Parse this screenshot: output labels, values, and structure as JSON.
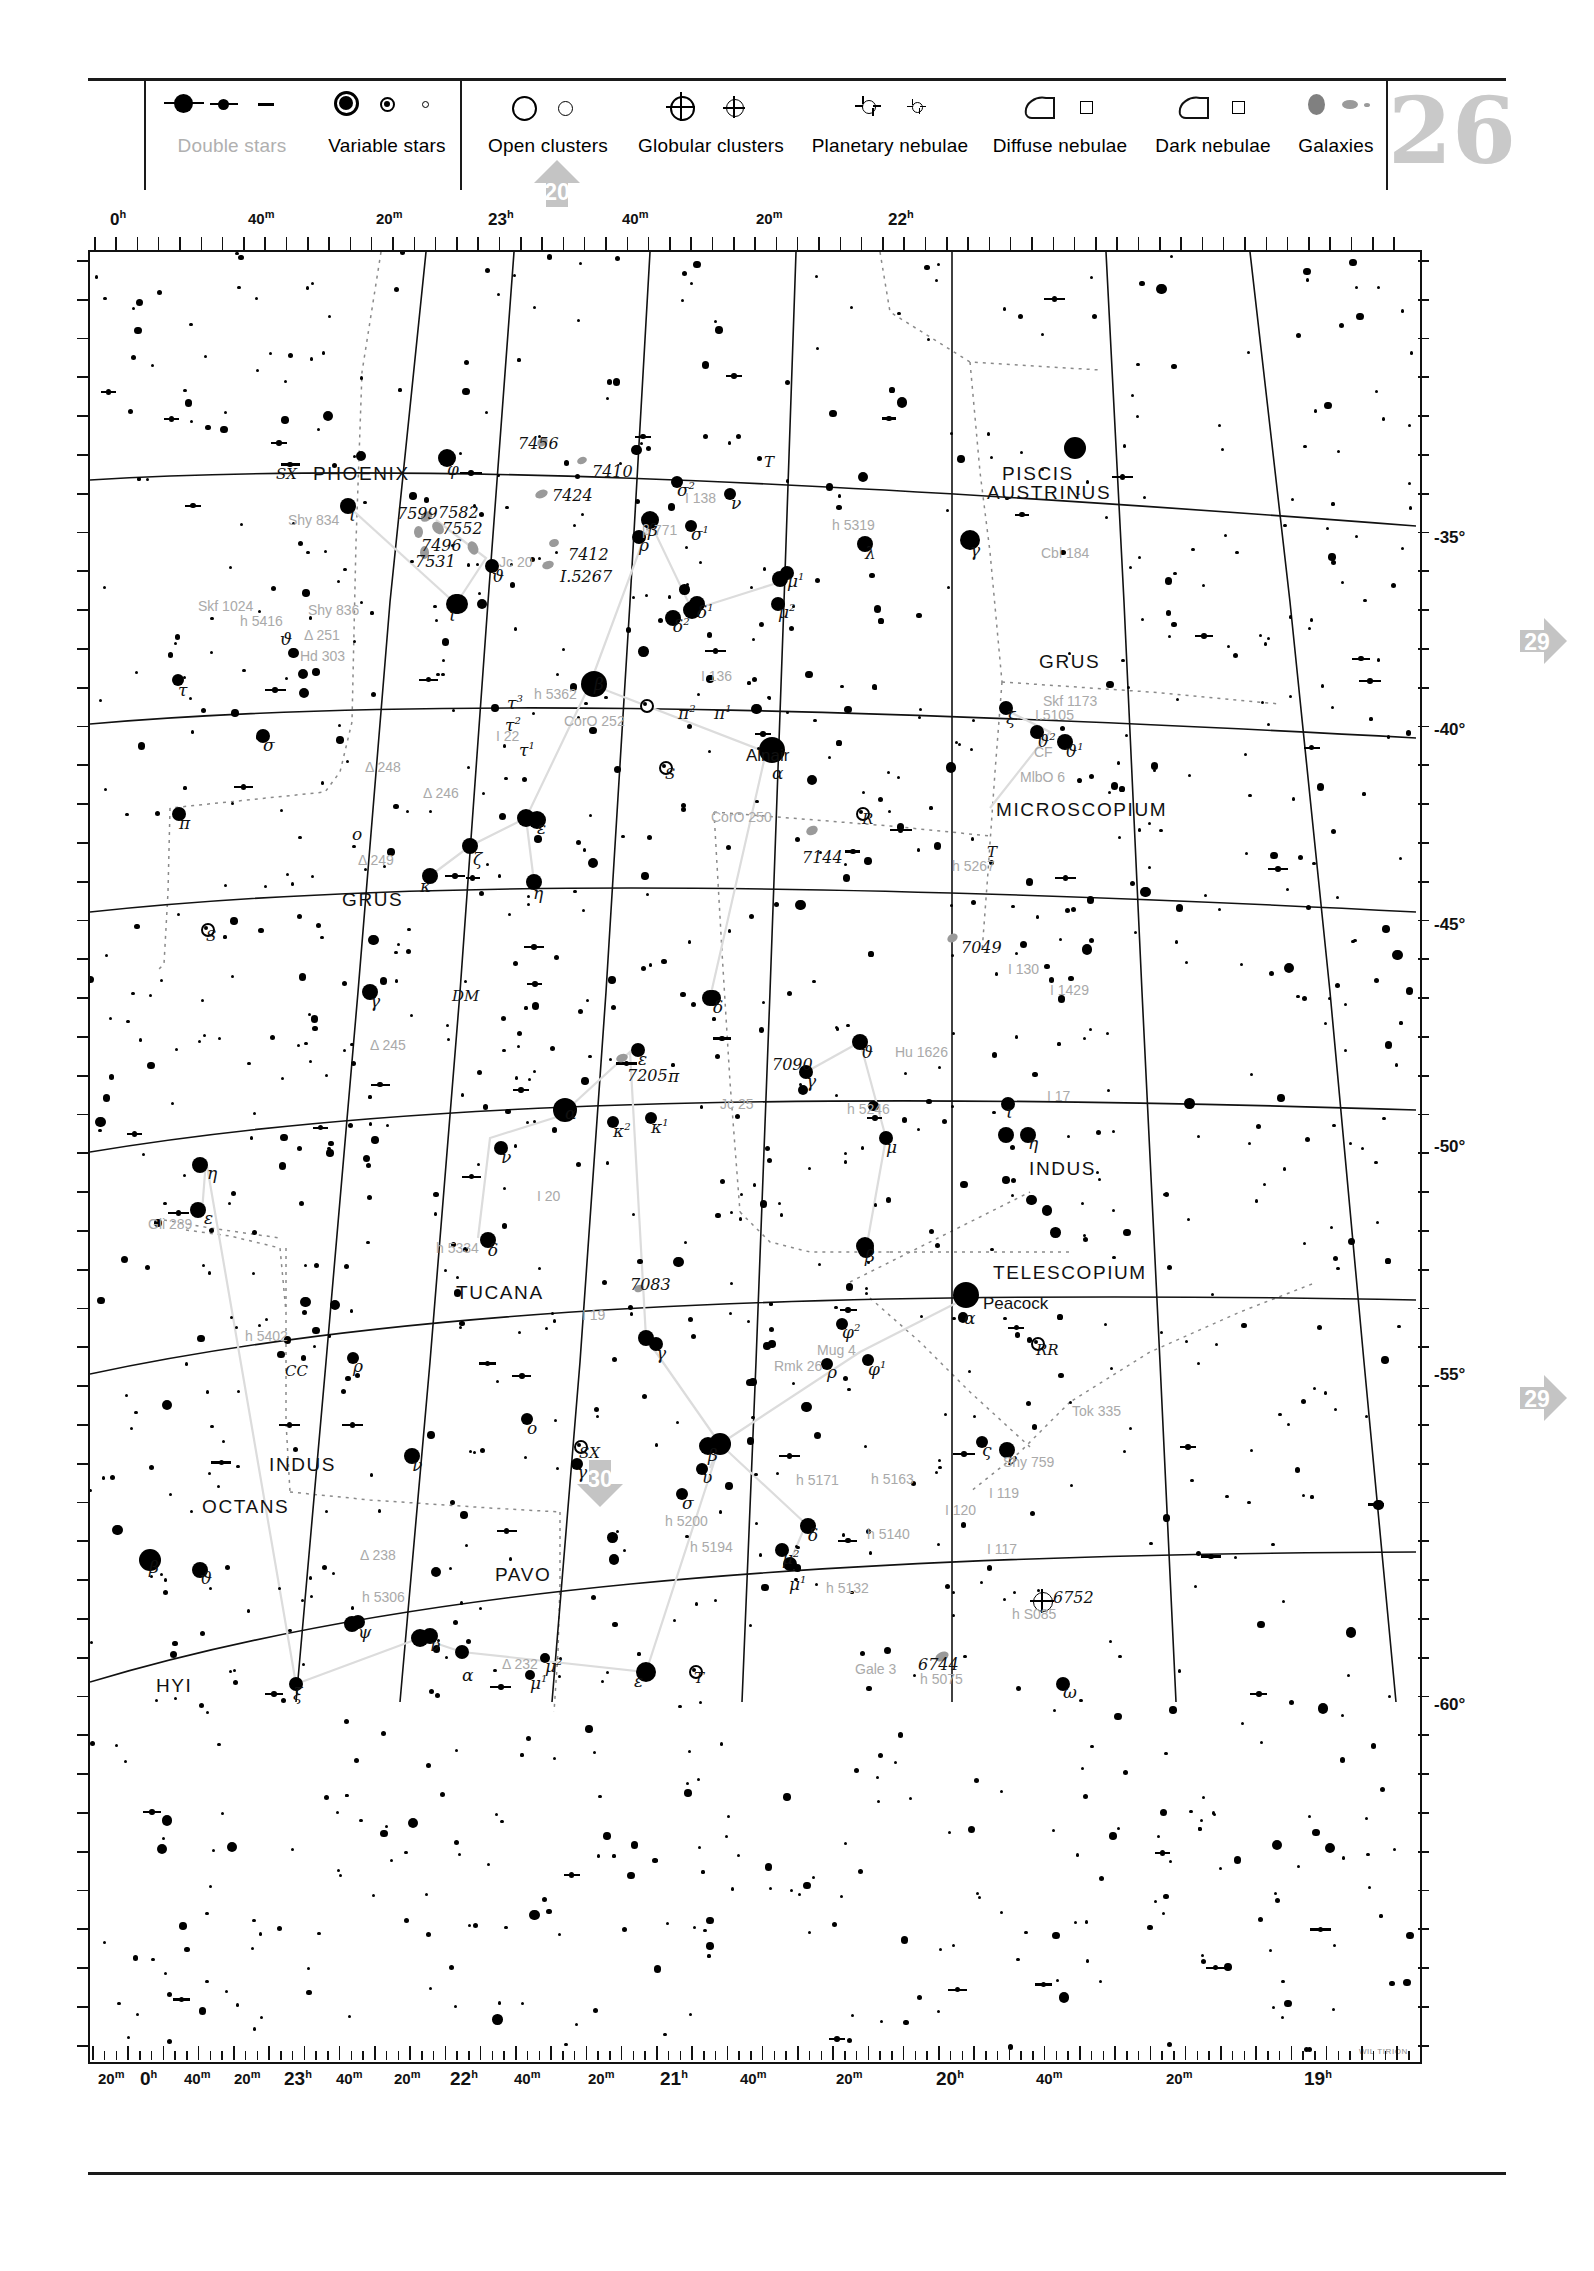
{
  "page": {
    "number": "26",
    "credit": "WIL TIRION"
  },
  "legend": {
    "groups": [
      {
        "items": [
          {
            "label": "Double stars",
            "icon": "double-star-symbol",
            "muted": true
          },
          {
            "label": "Variable stars",
            "icon": "variable-star-symbol",
            "muted": false
          }
        ]
      },
      {
        "items": [
          {
            "label": "Open clusters",
            "icon": "open-cluster-symbol",
            "muted": false
          },
          {
            "label": "Globular clusters",
            "icon": "globular-cluster-symbol",
            "muted": false
          },
          {
            "label": "Planetary nebulae",
            "icon": "planetary-nebula-symbol",
            "muted": false
          },
          {
            "label": "Diffuse nebulae",
            "icon": "diffuse-nebula-symbol",
            "muted": false
          },
          {
            "label": "Dark nebulae",
            "icon": "dark-nebula-symbol",
            "muted": false
          },
          {
            "label": "Galaxies",
            "icon": "galaxy-symbol",
            "muted": false
          }
        ]
      }
    ]
  },
  "chart": {
    "ra_top": [
      {
        "label": "0h",
        "x": 22
      },
      {
        "label": "40m",
        "x": 160
      },
      {
        "label": "20m",
        "x": 288
      },
      {
        "label": "23h",
        "x": 400
      },
      {
        "label": "40m",
        "x": 534
      },
      {
        "label": "20m",
        "x": 668
      },
      {
        "label": "22h",
        "x": 800
      }
    ],
    "ra_bottom": [
      {
        "label": "20m",
        "x": 10
      },
      {
        "label": "0h",
        "x": 52
      },
      {
        "label": "40m",
        "x": 96
      },
      {
        "label": "20m",
        "x": 146
      },
      {
        "label": "23h",
        "x": 196
      },
      {
        "label": "40m",
        "x": 248
      },
      {
        "label": "20m",
        "x": 306
      },
      {
        "label": "22h",
        "x": 362
      },
      {
        "label": "40m",
        "x": 426
      },
      {
        "label": "20m",
        "x": 500
      },
      {
        "label": "21h",
        "x": 572
      },
      {
        "label": "40m",
        "x": 652
      },
      {
        "label": "20m",
        "x": 748
      },
      {
        "label": "20h",
        "x": 848
      },
      {
        "label": "40m",
        "x": 948
      },
      {
        "label": "20m",
        "x": 1078
      },
      {
        "label": "19h",
        "x": 1216
      }
    ],
    "dec_labels": [
      {
        "label": "-35°",
        "y": 278
      },
      {
        "label": "-40°",
        "y": 470
      },
      {
        "label": "-45°",
        "y": 665
      },
      {
        "label": "-50°",
        "y": 887
      },
      {
        "label": "-55°",
        "y": 1115
      },
      {
        "label": "-60°",
        "y": 1445
      }
    ],
    "neighbour_arrows": [
      {
        "number": "20",
        "direction": "up",
        "x": 530,
        "y": 157
      },
      {
        "number": "29",
        "direction": "right",
        "x": 1516,
        "y": 614
      },
      {
        "number": "29",
        "direction": "right",
        "x": 1516,
        "y": 1371
      },
      {
        "number": "30",
        "direction": "down",
        "x": 573,
        "y": 1456
      }
    ],
    "constellations": [
      {
        "name": "PHOENIX",
        "x": 223,
        "y": 211
      },
      {
        "name": "PISCIS",
        "x": 912,
        "y": 211
      },
      {
        "name": "AUSTRINUS",
        "x": 897,
        "y": 230
      },
      {
        "name": "GRUS",
        "x": 949,
        "y": 399
      },
      {
        "name": "MICROSCOPIUM",
        "x": 906,
        "y": 547
      },
      {
        "name": "GRUS",
        "x": 252,
        "y": 637
      },
      {
        "name": "INDUS",
        "x": 939,
        "y": 906
      },
      {
        "name": "TUCANA",
        "x": 366,
        "y": 1030
      },
      {
        "name": "TELESCOPIUM",
        "x": 903,
        "y": 1010
      },
      {
        "name": "INDUS",
        "x": 179,
        "y": 1202
      },
      {
        "name": "OCTANS",
        "x": 112,
        "y": 1244
      },
      {
        "name": "PAVO",
        "x": 405,
        "y": 1312
      },
      {
        "name": "HYI",
        "x": 66,
        "y": 1423
      }
    ],
    "proper_names": [
      {
        "name": "Alnair",
        "x": 656,
        "y": 494
      },
      {
        "name": "Peacock",
        "x": 893,
        "y": 1042
      }
    ],
    "greek_labels": [
      {
        "t": "ι",
        "x": 985,
        "y": 227
      },
      {
        "t": "φ",
        "x": 357,
        "y": 207
      },
      {
        "t": "ι",
        "x": 259,
        "y": 253
      },
      {
        "t": "σ²",
        "x": 587,
        "y": 228
      },
      {
        "t": "ν",
        "x": 641,
        "y": 241
      },
      {
        "t": "β",
        "x": 558,
        "y": 268
      },
      {
        "t": "ρ",
        "x": 549,
        "y": 283
      },
      {
        "t": "σ¹",
        "x": 601,
        "y": 272
      },
      {
        "t": "γ",
        "x": 880,
        "y": 288
      },
      {
        "t": "λ",
        "x": 775,
        "y": 291
      },
      {
        "t": "ϑ",
        "x": 402,
        "y": 314
      },
      {
        "t": "μ¹",
        "x": 697,
        "y": 319
      },
      {
        "t": "ι",
        "x": 359,
        "y": 353
      },
      {
        "t": "δ¹",
        "x": 607,
        "y": 350
      },
      {
        "t": "μ²",
        "x": 688,
        "y": 350
      },
      {
        "t": "δ²",
        "x": 583,
        "y": 364
      },
      {
        "t": "ϑ",
        "x": 190,
        "y": 377
      },
      {
        "t": "τ",
        "x": 88,
        "y": 428
      },
      {
        "t": "β",
        "x": 504,
        "y": 422
      },
      {
        "t": "ξ",
        "x": 916,
        "y": 456
      },
      {
        "t": "τ³",
        "x": 417,
        "y": 441
      },
      {
        "t": "ϑ²",
        "x": 947,
        "y": 479
      },
      {
        "t": "τ²",
        "x": 415,
        "y": 463
      },
      {
        "t": "ϑ¹",
        "x": 975,
        "y": 489
      },
      {
        "t": "τ¹",
        "x": 429,
        "y": 488
      },
      {
        "t": "π²",
        "x": 588,
        "y": 451
      },
      {
        "t": "π¹",
        "x": 624,
        "y": 451
      },
      {
        "t": "α",
        "x": 682,
        "y": 511
      },
      {
        "t": "σ",
        "x": 173,
        "y": 483
      },
      {
        "t": "π",
        "x": 89,
        "y": 561
      },
      {
        "t": "ο",
        "x": 262,
        "y": 572
      },
      {
        "t": "ε",
        "x": 447,
        "y": 566
      },
      {
        "t": "ζ",
        "x": 383,
        "y": 597
      },
      {
        "t": "κ",
        "x": 330,
        "y": 624
      },
      {
        "t": "η",
        "x": 443,
        "y": 631
      },
      {
        "t": "γ",
        "x": 280,
        "y": 739
      },
      {
        "t": "δ",
        "x": 623,
        "y": 745
      },
      {
        "t": "ϑ",
        "x": 771,
        "y": 790
      },
      {
        "t": "ε",
        "x": 548,
        "y": 797
      },
      {
        "t": "γ",
        "x": 716,
        "y": 819
      },
      {
        "t": "π",
        "x": 578,
        "y": 814
      },
      {
        "t": "ι",
        "x": 916,
        "y": 850
      },
      {
        "t": "α",
        "x": 475,
        "y": 851
      },
      {
        "t": "κ²",
        "x": 523,
        "y": 869
      },
      {
        "t": "κ¹",
        "x": 561,
        "y": 865
      },
      {
        "t": "η",
        "x": 938,
        "y": 881
      },
      {
        "t": "ν",
        "x": 411,
        "y": 895
      },
      {
        "t": "μ",
        "x": 796,
        "y": 885
      },
      {
        "t": "η",
        "x": 117,
        "y": 911
      },
      {
        "t": "ε",
        "x": 114,
        "y": 956
      },
      {
        "t": "δ",
        "x": 398,
        "y": 988
      },
      {
        "t": "β",
        "x": 775,
        "y": 994
      },
      {
        "t": "α",
        "x": 874,
        "y": 1056
      },
      {
        "t": "γ",
        "x": 566,
        "y": 1091
      },
      {
        "t": "φ²",
        "x": 752,
        "y": 1070
      },
      {
        "t": "φ¹",
        "x": 778,
        "y": 1107
      },
      {
        "t": "ρ",
        "x": 737,
        "y": 1110
      },
      {
        "t": "ρ",
        "x": 263,
        "y": 1104
      },
      {
        "t": "ο",
        "x": 437,
        "y": 1166
      },
      {
        "t": "ς",
        "x": 892,
        "y": 1188
      },
      {
        "t": "γ",
        "x": 487,
        "y": 1210
      },
      {
        "t": "ν",
        "x": 322,
        "y": 1203
      },
      {
        "t": "β",
        "x": 618,
        "y": 1193
      },
      {
        "t": "ο",
        "x": 505,
        "y": 1229
      },
      {
        "t": "υ",
        "x": 612,
        "y": 1215
      },
      {
        "t": "σ",
        "x": 592,
        "y": 1241
      },
      {
        "t": "δ",
        "x": 718,
        "y": 1273
      },
      {
        "t": "β",
        "x": 59,
        "y": 1305
      },
      {
        "t": "ϑ",
        "x": 110,
        "y": 1316
      },
      {
        "t": "μ²",
        "x": 692,
        "y": 1296
      },
      {
        "t": "μ¹",
        "x": 699,
        "y": 1322
      },
      {
        "t": "ψ",
        "x": 268,
        "y": 1370
      },
      {
        "t": "ν",
        "x": 340,
        "y": 1383
      },
      {
        "t": "ξ",
        "x": 203,
        "y": 1432
      },
      {
        "t": "α",
        "x": 372,
        "y": 1413
      },
      {
        "t": "μ²",
        "x": 455,
        "y": 1404
      },
      {
        "t": "μ¹",
        "x": 440,
        "y": 1421
      },
      {
        "t": "ε",
        "x": 544,
        "y": 1419
      },
      {
        "t": "ω",
        "x": 973,
        "y": 1430
      },
      {
        "t": "ν",
        "x": 917,
        "y": 1197
      }
    ],
    "variable_labels": [
      {
        "t": "SX",
        "x": 186,
        "y": 213
      },
      {
        "t": "T",
        "x": 674,
        "y": 201
      },
      {
        "t": "S",
        "x": 575,
        "y": 513
      },
      {
        "t": "R",
        "x": 772,
        "y": 558
      },
      {
        "t": "S",
        "x": 116,
        "y": 675
      },
      {
        "t": "DM",
        "x": 362,
        "y": 735
      },
      {
        "t": "T",
        "x": 897,
        "y": 591
      },
      {
        "t": "RR",
        "x": 946,
        "y": 1089
      },
      {
        "t": "SX",
        "x": 489,
        "y": 1192
      },
      {
        "t": "CC",
        "x": 195,
        "y": 1110
      },
      {
        "t": "T",
        "x": 604,
        "y": 1417
      }
    ],
    "deepsky_labels": [
      {
        "t": "7456",
        "x": 428,
        "y": 182
      },
      {
        "t": "7410",
        "x": 502,
        "y": 210
      },
      {
        "t": "7424",
        "x": 462,
        "y": 234
      },
      {
        "t": "7599",
        "x": 307,
        "y": 252
      },
      {
        "t": "7582",
        "x": 348,
        "y": 251
      },
      {
        "t": "7552",
        "x": 352,
        "y": 267
      },
      {
        "t": "7496",
        "x": 331,
        "y": 284
      },
      {
        "t": "7531",
        "x": 325,
        "y": 300
      },
      {
        "t": "7412",
        "x": 478,
        "y": 293
      },
      {
        "t": "I.5267",
        "x": 470,
        "y": 315
      },
      {
        "t": "7144",
        "x": 712,
        "y": 596
      },
      {
        "t": "7049",
        "x": 871,
        "y": 686
      },
      {
        "t": "7205",
        "x": 537,
        "y": 814
      },
      {
        "t": "7090",
        "x": 682,
        "y": 803
      },
      {
        "t": "7083",
        "x": 540,
        "y": 1023
      },
      {
        "t": "6752",
        "x": 963,
        "y": 1336
      },
      {
        "t": "6744",
        "x": 828,
        "y": 1403
      }
    ],
    "double_labels": [
      {
        "t": "Shy 834",
        "x": 198,
        "y": 260
      },
      {
        "t": "Skf 1024",
        "x": 108,
        "y": 346
      },
      {
        "t": "h 5416",
        "x": 150,
        "y": 361
      },
      {
        "t": "Shy 836",
        "x": 218,
        "y": 350
      },
      {
        "t": "Δ 251",
        "x": 214,
        "y": 375
      },
      {
        "t": "Hd 303",
        "x": 210,
        "y": 396
      },
      {
        "t": "Jc 20",
        "x": 409,
        "y": 302
      },
      {
        "t": "I 138",
        "x": 595,
        "y": 238
      },
      {
        "t": "h 5319",
        "x": 742,
        "y": 265
      },
      {
        "t": "Cbl 184",
        "x": 951,
        "y": 293
      },
      {
        "t": "β 771",
        "x": 552,
        "y": 270
      },
      {
        "t": "h 5362",
        "x": 444,
        "y": 434
      },
      {
        "t": "I 136",
        "x": 611,
        "y": 416
      },
      {
        "t": "Skf 1173",
        "x": 953,
        "y": 441
      },
      {
        "t": "CorO 252",
        "x": 474,
        "y": 461
      },
      {
        "t": "I.5105",
        "x": 945,
        "y": 455
      },
      {
        "t": "I 22",
        "x": 406,
        "y": 476
      },
      {
        "t": "CF",
        "x": 944,
        "y": 492
      },
      {
        "t": "Δ 248",
        "x": 275,
        "y": 507
      },
      {
        "t": "MlbO 6",
        "x": 930,
        "y": 517
      },
      {
        "t": "Δ 246",
        "x": 333,
        "y": 533
      },
      {
        "t": "CorO 250",
        "x": 621,
        "y": 557
      },
      {
        "t": "Δ 249",
        "x": 268,
        "y": 600
      },
      {
        "t": "h 5267",
        "x": 862,
        "y": 606
      },
      {
        "t": "Δ 245",
        "x": 280,
        "y": 785
      },
      {
        "t": "I 130",
        "x": 918,
        "y": 709
      },
      {
        "t": "I 1429",
        "x": 960,
        "y": 730
      },
      {
        "t": "Hu 1626",
        "x": 805,
        "y": 792
      },
      {
        "t": "h 5246",
        "x": 757,
        "y": 849
      },
      {
        "t": "I 17",
        "x": 957,
        "y": 836
      },
      {
        "t": "Jc 25",
        "x": 630,
        "y": 844
      },
      {
        "t": "I 20",
        "x": 447,
        "y": 936
      },
      {
        "t": "h 5334",
        "x": 346,
        "y": 988
      },
      {
        "t": "Gli 289",
        "x": 58,
        "y": 964
      },
      {
        "t": "I 19",
        "x": 492,
        "y": 1055
      },
      {
        "t": "Mug 4",
        "x": 727,
        "y": 1090
      },
      {
        "t": "Rmk 26",
        "x": 684,
        "y": 1106
      },
      {
        "t": "h 5402",
        "x": 155,
        "y": 1076
      },
      {
        "t": "Tok 335",
        "x": 982,
        "y": 1151
      },
      {
        "t": "Shy 759",
        "x": 913,
        "y": 1202
      },
      {
        "t": "h 5171",
        "x": 706,
        "y": 1220
      },
      {
        "t": "h 5163",
        "x": 781,
        "y": 1219
      },
      {
        "t": "I 119",
        "x": 899,
        "y": 1233
      },
      {
        "t": "h 5200",
        "x": 575,
        "y": 1261
      },
      {
        "t": "h 5194",
        "x": 600,
        "y": 1287
      },
      {
        "t": "h 5140",
        "x": 777,
        "y": 1274
      },
      {
        "t": "I 120",
        "x": 855,
        "y": 1250
      },
      {
        "t": "I 117",
        "x": 897,
        "y": 1289
      },
      {
        "t": "Δ 238",
        "x": 270,
        "y": 1295
      },
      {
        "t": "h 5132",
        "x": 736,
        "y": 1328
      },
      {
        "t": "h 5306",
        "x": 272,
        "y": 1337
      },
      {
        "t": "h S085",
        "x": 922,
        "y": 1354
      },
      {
        "t": "Δ 232",
        "x": 412,
        "y": 1404
      },
      {
        "t": "Gale 3",
        "x": 765,
        "y": 1409
      },
      {
        "t": "h 5075",
        "x": 830,
        "y": 1419
      }
    ]
  }
}
